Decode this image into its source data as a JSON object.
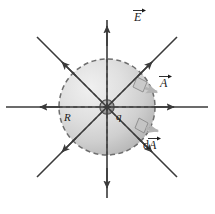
{
  "figure": {
    "background_color": "#ffffff",
    "width": 215,
    "height": 214
  },
  "labels": {
    "field_vector": {
      "symbol": "E",
      "vector": true,
      "name": "electric-field-vector-label"
    },
    "area_vector": {
      "symbol": "A",
      "vector": true,
      "name": "area-vector-label"
    },
    "differential_area_vector": {
      "prefix": "d",
      "symbol": "A",
      "vector": true,
      "name": "differential-area-vector-label"
    },
    "radius": {
      "symbol": "R",
      "vector": false,
      "name": "radius-label"
    },
    "charge": {
      "symbol": "q",
      "vector": false,
      "name": "charge-label"
    },
    "charge_sign": {
      "symbol": "+",
      "name": "positive-charge-sign"
    }
  },
  "colors": {
    "line": "#3a3a3a",
    "dashed": "#6e6e6e",
    "sphere_light": "#ededed",
    "sphere_mid": "#d8d8d8",
    "sphere_dark": "#b9b9b9",
    "charge_fill": "#9a9a9a",
    "charge_stroke": "#4a4a4a",
    "pointer": "#b3b3b3",
    "text": "#1a1a1a"
  },
  "geometry": {
    "center": {
      "x": 107,
      "y": 107
    },
    "sphere_radius": 48,
    "field_line_count": 8,
    "field_line_directions": [
      "up",
      "up-right",
      "right",
      "down-right",
      "down",
      "down-left",
      "left",
      "up-left"
    ],
    "field_line_outer_radius": 100,
    "dashed_radii_count": 8,
    "arrowheads_at_midline": true
  },
  "patches": {
    "area_patch": {
      "name": "area-element-patch",
      "angle_deg": -42
    },
    "differential_patch": {
      "name": "differential-area-patch",
      "angle_deg": 35
    }
  }
}
